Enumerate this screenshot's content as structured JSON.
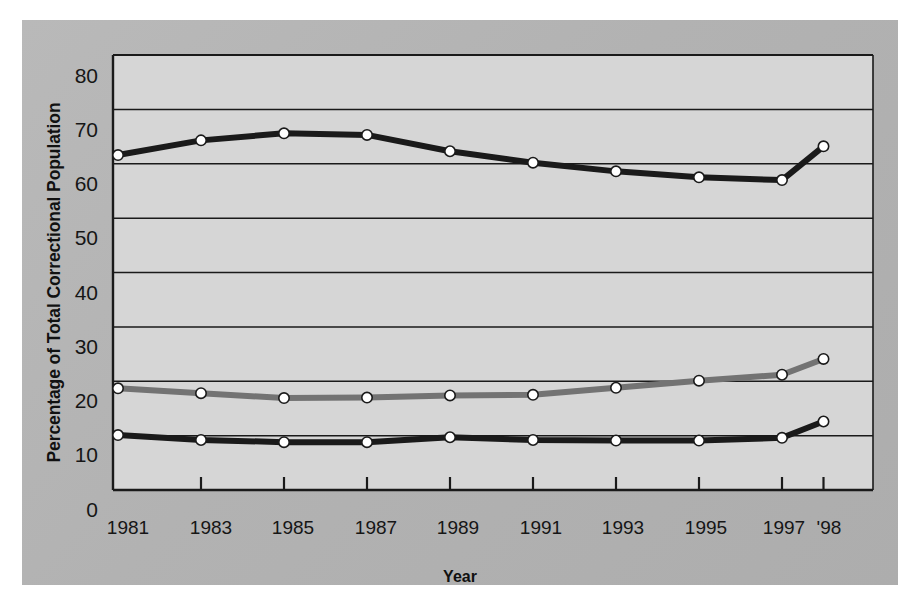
{
  "figure": {
    "panel_background": "#b4b4b4",
    "plot_background": "#d6d6d6",
    "axis_color": "#000000"
  },
  "chart_data": {
    "type": "line",
    "title": "",
    "xlabel": "Year",
    "ylabel": "Percentage of Total Correctional Population",
    "categories": [
      "1981",
      "1983",
      "1985",
      "1987",
      "1989",
      "1991",
      "1993",
      "1995",
      "1997",
      "'98"
    ],
    "x_tick_labels": [
      "1981",
      "1983",
      "1985",
      "1987",
      "1989",
      "1991",
      "1993",
      "1995",
      "1997",
      "'98"
    ],
    "y_tick_labels": [
      "0",
      "10",
      "20",
      "30",
      "40",
      "50",
      "60",
      "70",
      "80"
    ],
    "y_ticks": [
      0,
      10,
      20,
      30,
      40,
      50,
      60,
      70,
      80
    ],
    "ylim": [
      0,
      80
    ],
    "xlim_years": [
      1981,
      1998
    ],
    "grid": "horizontal",
    "legend_position": "inline-right-of-series",
    "series": [
      {
        "name": "Probation",
        "color": "#1a1a1a",
        "values": [
          61.6,
          64.3,
          65.6,
          65.3,
          62.3,
          60.2,
          58.6,
          57.5,
          57.0,
          63.2
        ]
      },
      {
        "name": "Prison",
        "color": "#737373",
        "values": [
          18.7,
          17.8,
          16.9,
          17.0,
          17.4,
          17.5,
          18.8,
          20.1,
          21.2,
          24.1
        ]
      },
      {
        "name": "Jail",
        "color": "#1a1a1a",
        "values": [
          10.1,
          9.2,
          8.8,
          8.8,
          9.7,
          9.2,
          9.1,
          9.1,
          9.6,
          12.6
        ]
      }
    ],
    "annotations": [
      {
        "text": "Probation",
        "x": 1997.0,
        "y": 69.0
      },
      {
        "text": "Prison",
        "x": 1996.9,
        "y": 27.8
      },
      {
        "text": "Jail",
        "x": 1996.9,
        "y": 16.3
      }
    ]
  }
}
